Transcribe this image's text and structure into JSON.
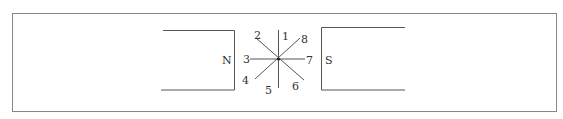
{
  "diagram": {
    "magnet_left": {
      "pole": "N"
    },
    "magnet_right": {
      "pole": "S"
    },
    "directions": [
      {
        "id": "1",
        "label": "1"
      },
      {
        "id": "2",
        "label": "2"
      },
      {
        "id": "3",
        "label": "3"
      },
      {
        "id": "4",
        "label": "4"
      },
      {
        "id": "5",
        "label": "5"
      },
      {
        "id": "6",
        "label": "6"
      },
      {
        "id": "7",
        "label": "7"
      },
      {
        "id": "8",
        "label": "8"
      }
    ],
    "colors": {
      "line": "#555555",
      "text": "#333333",
      "frame": "#888888"
    }
  }
}
